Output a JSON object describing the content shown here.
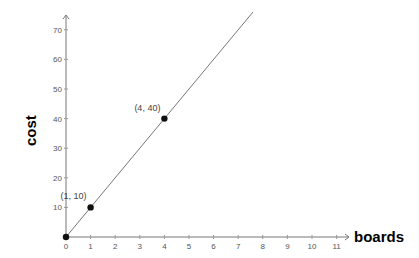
{
  "chart_data": {
    "type": "line",
    "title": "",
    "xlabel": "boards",
    "ylabel": "cost",
    "x_ticks": [
      0,
      1,
      2,
      3,
      4,
      5,
      6,
      7,
      8,
      9,
      10,
      11
    ],
    "y_ticks": [
      10,
      20,
      30,
      40,
      50,
      60,
      70
    ],
    "xlim": [
      0,
      11.5
    ],
    "ylim": [
      0,
      75
    ],
    "grid": false,
    "series": [
      {
        "name": "cost = 10 × boards",
        "x": [
          0,
          7.6
        ],
        "y": [
          0,
          76
        ],
        "style": "line"
      }
    ],
    "points": [
      {
        "x": 0,
        "y": 0,
        "label": ""
      },
      {
        "x": 1,
        "y": 10,
        "label": "(1, 10)"
      },
      {
        "x": 4,
        "y": 40,
        "label": "(4, 40)"
      }
    ]
  }
}
